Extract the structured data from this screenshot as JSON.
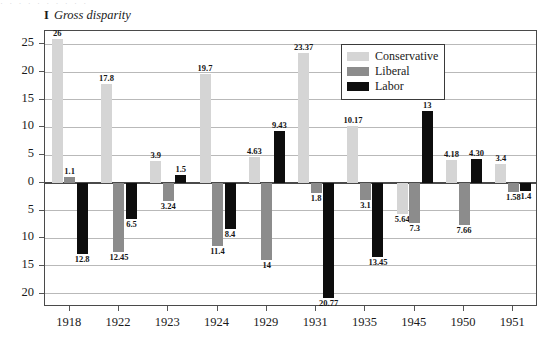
{
  "figure": {
    "number": "I",
    "title": "Gross disparity",
    "top_sliver": "· · · · · · · · · ·"
  },
  "legend": {
    "position": "top-right-inside",
    "items": [
      {
        "label": "Conservative",
        "color": "#d5d5d5"
      },
      {
        "label": "Liberal",
        "color": "#8c8c8c"
      },
      {
        "label": "Labor",
        "color": "#0d0d0d"
      }
    ]
  },
  "axes": {
    "y_tick_labels": [
      "25",
      "20",
      "15",
      "10",
      "5",
      "0",
      "5",
      "10",
      "15",
      "20"
    ],
    "y_tick_values": [
      25,
      20,
      15,
      10,
      5,
      0,
      -5,
      -10,
      -15,
      -20
    ],
    "x_tick_labels": [
      "1918",
      "1922",
      "1923",
      "1924",
      "1929",
      "1931",
      "1935",
      "1945",
      "1950",
      "1951"
    ]
  },
  "chart_data": {
    "type": "bar",
    "title": "Gross disparity",
    "xlabel": "",
    "ylabel": "",
    "ylim": [
      -22,
      27
    ],
    "grid": true,
    "legend_position": "top-right",
    "categories": [
      "1918",
      "1922",
      "1923",
      "1924",
      "1929",
      "1931",
      "1935",
      "1945",
      "1950",
      "1951"
    ],
    "series": [
      {
        "name": "Conservative",
        "color": "#d5d5d5",
        "values": [
          26,
          17.8,
          3.9,
          19.7,
          4.63,
          23.37,
          10.17,
          -5.64,
          4.18,
          3.4
        ],
        "labels": [
          "26",
          "17.8",
          "3.9",
          "19.7",
          "4.63",
          "23.37",
          "10.17",
          "5.64",
          "4.18",
          "3.4"
        ]
      },
      {
        "name": "Liberal",
        "color": "#8c8c8c",
        "values": [
          1.1,
          -12.45,
          -3.24,
          -11.4,
          -14,
          -1.8,
          -3.1,
          -7.3,
          -7.66,
          -1.58
        ],
        "labels": [
          "1.1",
          "12.45",
          "3.24",
          "11.4",
          "14",
          "1.8",
          "3.1",
          "7.3",
          "7.66",
          "1.58"
        ]
      },
      {
        "name": "Labor",
        "color": "#0d0d0d",
        "values": [
          -12.8,
          -6.5,
          1.5,
          -8.4,
          9.43,
          -20.77,
          -13.45,
          13,
          4.3,
          -1.4
        ],
        "labels": [
          "12.8",
          "6.5",
          "1.5",
          "8.4",
          "9.43",
          "20.77",
          "13.45",
          "13",
          "4.30",
          "1.4"
        ]
      }
    ]
  }
}
